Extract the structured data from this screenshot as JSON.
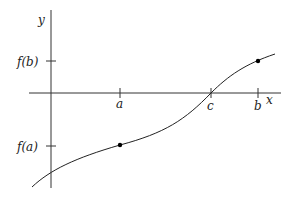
{
  "diagram": {
    "type": "function-graph",
    "axes": {
      "x_label": "x",
      "y_label": "y"
    },
    "x_ticks": [
      {
        "label": "a",
        "x": 120
      },
      {
        "label": "c",
        "x": 211
      },
      {
        "label": "b",
        "x": 258
      }
    ],
    "y_ticks": [
      {
        "label": "f(b)",
        "y": 61
      },
      {
        "label": "f(a)",
        "y": 146
      }
    ],
    "points": [
      {
        "name": "a-fa",
        "x": 120,
        "y": 145
      },
      {
        "name": "b-fb",
        "x": 258,
        "y": 61
      }
    ],
    "colors": {
      "line": "#222222",
      "background": "#ffffff"
    }
  }
}
